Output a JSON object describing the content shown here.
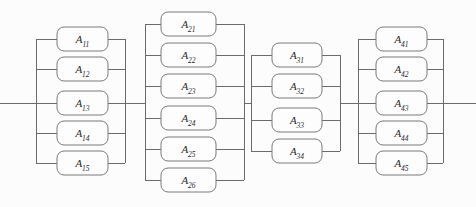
{
  "diagram": {
    "type": "reliability-block-diagram",
    "background_color": "#fcfcfc",
    "line_color": "#6b6b6b",
    "box_fill_color": "#fdfdfd",
    "box_stroke_color": "#7a7a7a",
    "label_color": "#2a2a2a",
    "main_line_y": 103,
    "input_terminal_x": 0,
    "output_terminal_x": 476,
    "groups": [
      {
        "group_id": "group-1",
        "subsystem_index": 1,
        "block_count": 5,
        "left_rail_x": 36,
        "right_rail_x": 125,
        "box_left_x": 57,
        "box_right_x": 108,
        "blocks": [
          {
            "label_base": "A",
            "label_sub": "11",
            "label": "A11",
            "y_top": 27,
            "y_bottom": 51,
            "y_center": 39
          },
          {
            "label_base": "A",
            "label_sub": "12",
            "label": "A12",
            "y_top": 57,
            "y_bottom": 81,
            "y_center": 69
          },
          {
            "label_base": "A",
            "label_sub": "13",
            "label": "A13",
            "y_top": 91,
            "y_bottom": 115,
            "y_center": 103
          },
          {
            "label_base": "A",
            "label_sub": "14",
            "label": "A14",
            "y_top": 121,
            "y_bottom": 145,
            "y_center": 133
          },
          {
            "label_base": "A",
            "label_sub": "15",
            "label": "A15",
            "y_top": 151,
            "y_bottom": 175,
            "y_center": 163
          }
        ]
      },
      {
        "group_id": "group-2",
        "subsystem_index": 2,
        "block_count": 6,
        "left_rail_x": 145,
        "right_rail_x": 244,
        "box_left_x": 161,
        "box_right_x": 216,
        "blocks": [
          {
            "label_base": "A",
            "label_sub": "21",
            "label": "A21",
            "y_top": 12,
            "y_bottom": 36,
            "y_center": 24
          },
          {
            "label_base": "A",
            "label_sub": "22",
            "label": "A22",
            "y_top": 43,
            "y_bottom": 67,
            "y_center": 55
          },
          {
            "label_base": "A",
            "label_sub": "23",
            "label": "A23",
            "y_top": 74,
            "y_bottom": 98,
            "y_center": 86
          },
          {
            "label_base": "A",
            "label_sub": "24",
            "label": "A24",
            "y_top": 106,
            "y_bottom": 130,
            "y_center": 118
          },
          {
            "label_base": "A",
            "label_sub": "25",
            "label": "A25",
            "y_top": 137,
            "y_bottom": 161,
            "y_center": 149
          },
          {
            "label_base": "A",
            "label_sub": "26",
            "label": "A26",
            "y_top": 168,
            "y_bottom": 192,
            "y_center": 180
          }
        ]
      },
      {
        "group_id": "group-3",
        "subsystem_index": 3,
        "block_count": 4,
        "left_rail_x": 251,
        "right_rail_x": 340,
        "box_left_x": 272,
        "box_right_x": 322,
        "blocks": [
          {
            "label_base": "A",
            "label_sub": "31",
            "label": "A31",
            "y_top": 43,
            "y_bottom": 67,
            "y_center": 55
          },
          {
            "label_base": "A",
            "label_sub": "32",
            "label": "A32",
            "y_top": 74,
            "y_bottom": 98,
            "y_center": 86
          },
          {
            "label_base": "A",
            "label_sub": "33",
            "label": "A33",
            "y_top": 108,
            "y_bottom": 132,
            "y_center": 120
          },
          {
            "label_base": "A",
            "label_sub": "34",
            "label": "A34",
            "y_top": 139,
            "y_bottom": 163,
            "y_center": 151
          }
        ]
      },
      {
        "group_id": "group-4",
        "subsystem_index": 4,
        "block_count": 5,
        "left_rail_x": 358,
        "right_rail_x": 443,
        "box_left_x": 376,
        "box_right_x": 427,
        "blocks": [
          {
            "label_base": "A",
            "label_sub": "41",
            "label": "A41",
            "y_top": 27,
            "y_bottom": 51,
            "y_center": 39
          },
          {
            "label_base": "A",
            "label_sub": "42",
            "label": "A42",
            "y_top": 57,
            "y_bottom": 81,
            "y_center": 69
          },
          {
            "label_base": "A",
            "label_sub": "43",
            "label": "A43",
            "y_top": 91,
            "y_bottom": 115,
            "y_center": 103
          },
          {
            "label_base": "A",
            "label_sub": "44",
            "label": "A44",
            "y_top": 121,
            "y_bottom": 145,
            "y_center": 133
          },
          {
            "label_base": "A",
            "label_sub": "45",
            "label": "A45",
            "y_top": 151,
            "y_bottom": 175,
            "y_center": 163
          }
        ]
      }
    ]
  }
}
